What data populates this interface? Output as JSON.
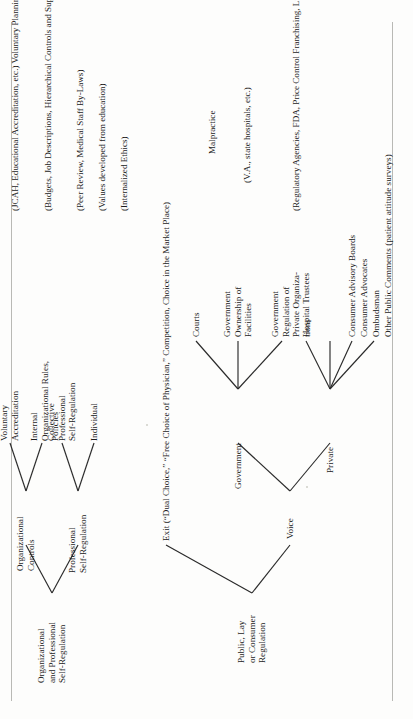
{
  "figure": {
    "type": "tree-diagram",
    "orientation": "rotated-90-ccw-on-page",
    "background_color": "#fdfdfc",
    "ink_color": "#1b1b1b",
    "rule_color": "#b9b9b5"
  },
  "tree": {
    "roots": [
      {
        "id": "org-prof",
        "label": "Organizational\nand Professional\nSelf-Regulation",
        "children": [
          {
            "id": "org-controls",
            "label": "Organizational\nControls",
            "children": [
              {
                "id": "vol-accred",
                "label": "Voluntary\nAccreditation",
                "annotation": "(JCAH, Educational Accreditation, etc.)\nVoluntary Planning"
              },
              {
                "id": "internal-rules",
                "label": "Internal\nOrganizational Rules,\nPolicies",
                "annotation": "(Budgets, Job Descriptions, Hierarchical Controls\nand Supervision, etc.)"
              }
            ]
          },
          {
            "id": "prof-selfreg",
            "label": "Professional\nSelf-Regulation",
            "children": [
              {
                "id": "collective",
                "label": "Collective\nProfessional\nSelf-Regulation",
                "annotation": "(Peer Review, Medical Staff By-Laws)"
              },
              {
                "id": "individual",
                "label": "Individual",
                "annotation": "(Values developed from education)\n\n(Internalized Ethics)"
              }
            ]
          }
        ]
      },
      {
        "id": "public-lay",
        "label": "Public, Lay\nor Consumer\nRegulation",
        "children": [
          {
            "id": "exit",
            "label": "Exit (“Dual Choice,” “Free Choice of Physician,” Competition, Choice in the Market Place)",
            "children": []
          },
          {
            "id": "voice",
            "label": "Voice",
            "children": [
              {
                "id": "government",
                "label": "Government",
                "children": [
                  {
                    "id": "courts",
                    "label": "Courts",
                    "annotation": "Malpractice"
                  },
                  {
                    "id": "gov-ownership",
                    "label": "Government\nOwnership of\nFacilities",
                    "annotation": "(V.A., state hospitals, etc.)"
                  },
                  {
                    "id": "gov-regulation",
                    "label": "Government\nRegulation of\nPrivate Organiza-\ntions",
                    "annotation": "(Regulatory Agencies, FDA, Price Control\nFranchising, Licensure, Regional Planning,\nCertificate of Need, Utility Regulation)"
                  }
                ]
              },
              {
                "id": "private",
                "label": "Private",
                "children": [
                  {
                    "id": "hospital-trustees",
                    "label": "Hospital Trustees",
                    "annotation": ""
                  },
                  {
                    "id": "consumer-advisory",
                    "label": "Consumer Advisory Boards",
                    "annotation": ""
                  },
                  {
                    "id": "consumer-advocates",
                    "label": "Consumer Advocates",
                    "annotation": ""
                  },
                  {
                    "id": "ombudsman",
                    "label": "Ombudsman",
                    "annotation": ""
                  },
                  {
                    "id": "other-public-comments",
                    "label": "Other Public Comments (patient attitude surveys)",
                    "annotation": ""
                  }
                ]
              }
            ]
          }
        ]
      }
    ]
  },
  "nodes": {
    "org_prof_root": "Organizational\nand Professional\nSelf-Regulation",
    "public_lay_root": "Public, Lay\nor Consumer\nRegulation",
    "organizational_controls": "Organizational\nControls",
    "professional_self_regulation": "Professional\nSelf-Regulation",
    "voluntary_accreditation": "Voluntary\nAccreditation",
    "internal_organizational_rules": "Internal\nOrganizational Rules,\nPolicies",
    "collective_professional": "Collective\nProfessional\nSelf-Regulation",
    "individual": "Individual",
    "exit": "Exit (“Dual Choice,” “Free Choice of Physician,” Competition, Choice in the Market Place)",
    "voice": "Voice",
    "government": "Government",
    "private": "Private",
    "courts": "Courts",
    "government_ownership": "Government\nOwnership of\nFacilities",
    "government_regulation": "Government\nRegulation of\nPrivate Organiza-\ntions",
    "hospital_trustees": "Hospital Trustees",
    "consumer_advisory_boards": "Consumer Advisory Boards",
    "consumer_advocates": "Consumer Advocates",
    "ombudsman": "Ombudsman",
    "other_public_comments": "Other Public Comments (patient attitude surveys)"
  },
  "annotations": {
    "voluntary_accreditation": "(JCAH, Educational Accreditation, etc.)\nVoluntary Planning",
    "internal_organizational_rules": "(Budgets, Job Descriptions, Hierarchical Controls\nand Supervision, etc.)",
    "collective_professional": "(Peer Review, Medical Staff By-Laws)",
    "individual_values": "(Values developed from education)",
    "individual_ethics": "(Internalized Ethics)",
    "courts": "Malpractice",
    "government_ownership": "(V.A., state hospitals, etc.)",
    "government_regulation": "(Regulatory Agencies, FDA, Price Control\nFranchising, Licensure, Regional Planning,\nCertificate of Need, Utility Regulation)"
  }
}
